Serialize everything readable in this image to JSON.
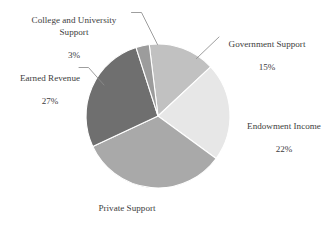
{
  "chart_data": {
    "type": "pie",
    "title": "",
    "subtitle": "",
    "xlabel": "",
    "ylabel": "",
    "legend_position": "none",
    "grid": false,
    "value_unit": "percent",
    "categories": [
      "Government Support",
      "Endowment Income",
      "Private Support",
      "Earned Revenue",
      "College and University Support"
    ],
    "values": [
      15,
      22,
      33,
      27,
      3
    ],
    "value_labels": [
      "15%",
      "22%",
      "33%",
      "27%",
      "3%"
    ],
    "colors": [
      "#c1c1c1",
      "#e7e7e7",
      "#a9a9a9",
      "#6f6f6f",
      "#9c9c9c"
    ],
    "slices": [
      {
        "name": "Government Support",
        "value": 15,
        "value_label": "15%",
        "color": "#c1c1c1",
        "start_angle": -7,
        "end_angle": 47
      },
      {
        "name": "Endowment Income",
        "value": 22,
        "value_label": "22%",
        "color": "#e7e7e7",
        "start_angle": 47,
        "end_angle": 126.2
      },
      {
        "name": "Private Support",
        "value": 33,
        "value_label": "33%",
        "color": "#a9a9a9",
        "start_angle": 126.2,
        "end_angle": 245
      },
      {
        "name": "Earned Revenue",
        "value": 27,
        "value_label": "27%",
        "color": "#6f6f6f",
        "start_angle": 245,
        "end_angle": 342.2
      },
      {
        "name": "College and University Support",
        "value": 3,
        "value_label": "3%",
        "color": "#9c9c9c",
        "start_angle": 342.2,
        "end_angle": 353
      }
    ]
  },
  "labels": {
    "college": {
      "name": "College and University\nSupport",
      "value": "3%"
    },
    "government": {
      "name": "Government Support",
      "value": "15%"
    },
    "endowment": {
      "name": "Endowment Income",
      "value": "22%"
    },
    "earned": {
      "name": "Earned Revenue",
      "value": "27%"
    },
    "private": {
      "name": "Private Support",
      "value": "33%"
    }
  }
}
